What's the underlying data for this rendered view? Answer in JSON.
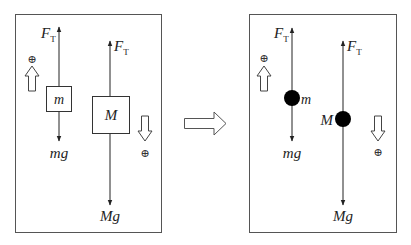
{
  "diagram": {
    "left_panel": {
      "title": "Block diagram",
      "tension_label_m": {
        "main": "F",
        "sub": "T"
      },
      "tension_label_M": {
        "main": "F",
        "sub": "T"
      },
      "block_m_label": "m",
      "block_M_label": "M",
      "weight_m_label": "mg",
      "weight_M_label": "Mg",
      "positive_m_symbol": "⊕",
      "positive_M_symbol": "⊕",
      "positive_m_direction": "up",
      "positive_M_direction": "down"
    },
    "transform_arrow": {
      "direction": "right"
    },
    "right_panel": {
      "title": "Free-body point diagram",
      "tension_label_m": {
        "main": "F",
        "sub": "T"
      },
      "tension_label_M": {
        "main": "F",
        "sub": "T"
      },
      "point_m_label": "m",
      "point_M_label": "M",
      "weight_m_label": "mg",
      "weight_M_label": "Mg",
      "positive_m_symbol": "⊕",
      "positive_M_symbol": "⊕",
      "positive_m_direction": "up",
      "positive_M_direction": "down"
    },
    "colors": {
      "stroke": "#333333",
      "fill_point": "#000000",
      "background": "#ffffff"
    }
  }
}
